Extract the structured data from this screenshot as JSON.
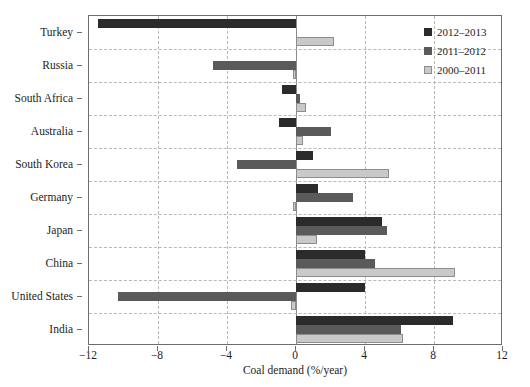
{
  "chart_data": {
    "type": "bar",
    "orientation": "horizontal",
    "title": "",
    "xlabel": "Coal demand (%/year)",
    "ylabel": "",
    "xlim": [
      -12,
      12
    ],
    "xticks": [
      -12,
      -8,
      -4,
      0,
      4,
      8,
      12
    ],
    "xticklabels": [
      "−12",
      "−8",
      "−4",
      "0",
      "4",
      "8",
      "12"
    ],
    "grid": true,
    "legend_position": "upper right",
    "categories": [
      "Turkey",
      "Russia",
      "South Africa",
      "Australia",
      "South Korea",
      "Germany",
      "Japan",
      "China",
      "United States",
      "India"
    ],
    "series": [
      {
        "name": "2012–2013",
        "color": "#2b2b2b",
        "values": [
          -11.5,
          0.0,
          -0.8,
          -1.0,
          1.0,
          1.3,
          5.0,
          4.0,
          4.0,
          9.1
        ]
      },
      {
        "name": "2011–2012",
        "color": "#5a5a5a",
        "values": [
          0.0,
          -4.8,
          0.25,
          2.0,
          -3.4,
          3.3,
          5.3,
          4.6,
          -10.3,
          6.1
        ]
      },
      {
        "name": "2000–2011",
        "color": "#c9c9c9",
        "values": [
          2.2,
          -0.15,
          0.6,
          0.4,
          5.4,
          -0.2,
          1.2,
          9.2,
          -0.3,
          6.2
        ]
      }
    ]
  },
  "legend": {
    "entries": [
      {
        "label": "2012–2013",
        "swatch": "dark-square-icon"
      },
      {
        "label": "2011–2012",
        "swatch": "medium-square-icon"
      },
      {
        "label": "2000–2011",
        "swatch": "light-square-icon"
      }
    ]
  },
  "axis": {
    "x_title": "Coal demand (%/year)"
  },
  "colors": {
    "series_2012_2013": "#2b2b2b",
    "series_2011_2012": "#5a5a5a",
    "series_2000_2011": "#c9c9c9",
    "axis": "#6d6d6d",
    "grid": "#b9b9b9",
    "background": "#ffffff"
  }
}
